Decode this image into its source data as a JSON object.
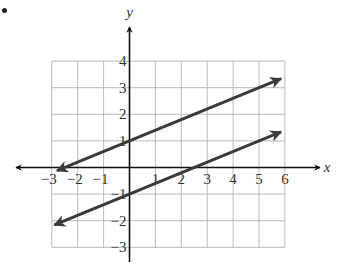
{
  "problem_marker": "•",
  "chart_data": {
    "type": "line",
    "title": "",
    "xlabel": "x",
    "ylabel": "y",
    "xlim": [
      -3,
      6
    ],
    "ylim": [
      -3,
      4
    ],
    "grid": true,
    "x_ticks": [
      "-3",
      "-2",
      "-1",
      "1",
      "2",
      "3",
      "4",
      "5",
      "6"
    ],
    "y_ticks": [
      "4",
      "3",
      "2",
      "1",
      "-1",
      "-2",
      "-3"
    ],
    "x_tick_values": [
      -3,
      -2,
      -1,
      1,
      2,
      3,
      4,
      5,
      6
    ],
    "y_tick_values": [
      4,
      3,
      2,
      1,
      -1,
      -2,
      -3
    ],
    "series": [
      {
        "name": "upper line",
        "equation": "y = 0.4x + 1",
        "slope": 0.4,
        "intercept": 1,
        "x": [
          -2.8,
          5.85
        ],
        "y": [
          -0.12,
          3.34
        ],
        "arrows": "both"
      },
      {
        "name": "lower line",
        "equation": "y = 0.4x - 1",
        "slope": 0.4,
        "intercept": -1,
        "x": [
          -2.9,
          5.85
        ],
        "y": [
          -2.16,
          1.34
        ],
        "arrows": "both"
      }
    ],
    "colors": {
      "line": "#3a3a3a",
      "axis": "#111111",
      "grid": "#bbbbbb",
      "text": "#333333"
    }
  }
}
